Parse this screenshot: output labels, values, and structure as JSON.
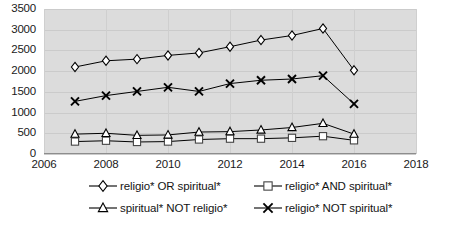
{
  "chart_data": {
    "type": "line",
    "title": "",
    "subtitle": "",
    "xlabel": "",
    "ylabel": "",
    "x": [
      2007,
      2008,
      2009,
      2010,
      2011,
      2012,
      2013,
      2014,
      2015,
      2016
    ],
    "xlim": [
      2006,
      2018
    ],
    "ylim": [
      0,
      3500
    ],
    "xticks": [
      "2006",
      "2008",
      "2010",
      "2012",
      "2014",
      "2016",
      "2018"
    ],
    "yticks": [
      "0",
      "500",
      "1000",
      "1500",
      "2000",
      "2500",
      "3000",
      "3500"
    ],
    "grid": true,
    "legend_position": "bottom",
    "plot_background": "#dcdcdc",
    "line_color": "#000000",
    "marker_fill": "#ffffff",
    "series": [
      {
        "name": "religio* OR spiritual*",
        "marker": "diamond",
        "values": [
          2100,
          2250,
          2290,
          2380,
          2440,
          2590,
          2750,
          2860,
          3030,
          2020
        ]
      },
      {
        "name": "religio* AND spiritual*",
        "marker": "square",
        "values": [
          300,
          320,
          290,
          300,
          350,
          370,
          370,
          390,
          430,
          330
        ]
      },
      {
        "name": "spiritual* NOT religio*",
        "marker": "triangle",
        "values": [
          480,
          500,
          450,
          460,
          530,
          540,
          580,
          640,
          740,
          480
        ]
      },
      {
        "name": "religio* NOT spiritual*",
        "marker": "cross",
        "values": [
          1270,
          1410,
          1510,
          1610,
          1510,
          1700,
          1780,
          1810,
          1890,
          1210
        ]
      }
    ]
  },
  "axis": {
    "y_labels": [
      "3500",
      "3000",
      "2500",
      "2000",
      "1500",
      "1000",
      "500",
      "0"
    ],
    "x_labels": [
      "2006",
      "2008",
      "2010",
      "2012",
      "2014",
      "2016",
      "2018"
    ]
  },
  "legend": {
    "items": [
      {
        "label": "religio* OR spiritual*",
        "marker": "diamond-marker-icon"
      },
      {
        "label": "religio* AND spiritual*",
        "marker": "square-marker-icon"
      },
      {
        "label": "spiritual* NOT religio*",
        "marker": "triangle-marker-icon"
      },
      {
        "label": "religio* NOT spiritual*",
        "marker": "cross-marker-icon"
      }
    ]
  }
}
